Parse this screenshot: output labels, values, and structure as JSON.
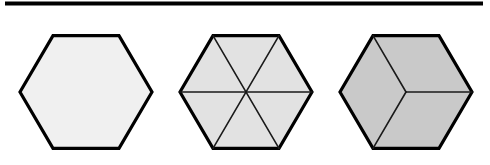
{
  "figure": {
    "caption_rule": {
      "name": "horizontal-rule",
      "x1": 5,
      "y1": 3.5,
      "x2": 483,
      "y2": 3.5,
      "thickness": 4,
      "color": "#000000"
    },
    "background_color": "#ffffff",
    "outline_color": "#000000",
    "outline_width": 3.2,
    "divider_color": "#1a1a1a",
    "divider_width": 1.6,
    "hexagons": [
      {
        "id": "hexagon-1",
        "label": "undivided-hexagon",
        "parts": 1,
        "center": {
          "x": 86,
          "y": 92
        },
        "radius_x": 66,
        "radius_y": 65,
        "orientation": "flat-top",
        "fill": "#f0f0f0",
        "dividers": []
      },
      {
        "id": "hexagon-2",
        "label": "six-triangle-hexagon",
        "parts": 6,
        "center": {
          "x": 246,
          "y": 92
        },
        "radius_x": 66,
        "radius_y": 65,
        "orientation": "flat-top",
        "fill": "#e2e2e2",
        "dividers": [
          "vertex-0-to-vertex-3",
          "vertex-1-to-vertex-4",
          "vertex-2-to-vertex-5"
        ]
      },
      {
        "id": "hexagon-3",
        "label": "three-rhombus-hexagon",
        "parts": 3,
        "center": {
          "x": 406,
          "y": 92
        },
        "radius_x": 66,
        "radius_y": 65,
        "orientation": "flat-top",
        "fill": "#c9c9c9",
        "dividers": [
          "center-to-vertex-0",
          "center-to-vertex-2",
          "center-to-vertex-4"
        ]
      }
    ]
  }
}
